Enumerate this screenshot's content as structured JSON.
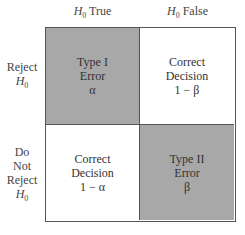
{
  "columns": [
    {
      "symbol": "H",
      "subscript": "0",
      "label": "True"
    },
    {
      "symbol": "H",
      "subscript": "0",
      "label": "False"
    }
  ],
  "rows": [
    {
      "lines": [
        "Reject"
      ],
      "symbol": "H",
      "subscript": "0"
    },
    {
      "lines": [
        "Do",
        "Not",
        "Reject"
      ],
      "symbol": "H",
      "subscript": "0"
    }
  ],
  "cells": {
    "top_left": {
      "lines": [
        "Type I",
        "Error",
        "α"
      ],
      "shaded": true
    },
    "top_right": {
      "lines": [
        "Correct",
        "Decision",
        "1 − β"
      ],
      "shaded": false
    },
    "bottom_left": {
      "lines": [
        "Correct",
        "Decision",
        "1 − α"
      ],
      "shaded": false
    },
    "bottom_right": {
      "lines": [
        "Type II",
        "Error",
        "β"
      ],
      "shaded": true
    }
  },
  "colors": {
    "shade": "#a8a8a8",
    "border": "#555555",
    "background": "#ffffff"
  }
}
